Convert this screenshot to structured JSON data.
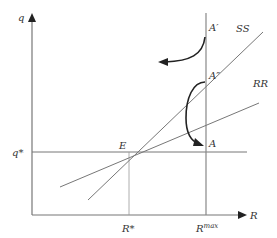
{
  "axes": {
    "y_label": "q",
    "x_label": "R"
  },
  "curves": {
    "ss_label": "SS",
    "rr_label": "RR",
    "q_star_label": "q*"
  },
  "points": {
    "e_label": "E",
    "a_label": "A",
    "a_prime_label": "A′",
    "a_double_prime_label": "A″"
  },
  "ticks": {
    "r_star_label": "R*",
    "r_max_base": "R",
    "r_max_sup": "max"
  },
  "colors": {
    "line": "#6a6a6a",
    "arrow": "#222222"
  }
}
